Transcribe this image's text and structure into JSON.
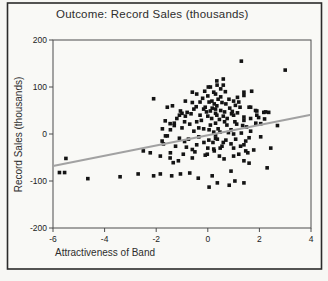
{
  "figure": {
    "background": "#f7f7f4",
    "outer_border_color": "#2b2b2b",
    "plot_frame_color": "#4d4d4d",
    "plot_bg": "#f9f9f6"
  },
  "chart_data": {
    "type": "scatter",
    "title": "Outcome: Record Sales (thousands)",
    "xlabel": "Attractiveness of Band",
    "ylabel": "Record Sales (thousands)",
    "xlim": [
      -6,
      4
    ],
    "ylim": [
      -200,
      200
    ],
    "x_ticks": [
      -6,
      -4,
      -2,
      0,
      2,
      4
    ],
    "y_ticks": [
      200,
      100,
      0,
      -100,
      -200
    ],
    "grid": false,
    "legend": "none",
    "marker": {
      "shape": "square",
      "size": 3.6,
      "color": "#141414"
    },
    "regression_line": {
      "x1": -6,
      "y1": -68,
      "x2": 4,
      "y2": 41,
      "color": "#a2a2a2",
      "width": 2.2
    },
    "points": [
      [
        -5.75,
        -82
      ],
      [
        -5.55,
        -82
      ],
      [
        -5.5,
        -52
      ],
      [
        -4.65,
        -95
      ],
      [
        -3.4,
        -91
      ],
      [
        -2.7,
        -85
      ],
      [
        -2.5,
        -36
      ],
      [
        -2.23,
        -40
      ],
      [
        -2.1,
        75
      ],
      [
        -2.1,
        -89
      ],
      [
        -1.84,
        -47
      ],
      [
        -1.84,
        -85
      ],
      [
        -1.77,
        -15
      ],
      [
        -1.76,
        11
      ],
      [
        -1.72,
        -21
      ],
      [
        -1.65,
        28
      ],
      [
        -1.64,
        -4
      ],
      [
        -1.57,
        57
      ],
      [
        -1.57,
        -4
      ],
      [
        -1.46,
        22
      ],
      [
        -1.46,
        -51
      ],
      [
        -1.45,
        9
      ],
      [
        -1.45,
        -40
      ],
      [
        -1.4,
        -89
      ],
      [
        -1.37,
        60
      ],
      [
        -1.34,
        -61
      ],
      [
        -1.3,
        18
      ],
      [
        -1.3,
        23
      ],
      [
        -1.25,
        -26
      ],
      [
        -1.2,
        33
      ],
      [
        -1.14,
        -57
      ],
      [
        -1.1,
        40
      ],
      [
        -1.1,
        -9
      ],
      [
        -1.06,
        49
      ],
      [
        -1.06,
        -85
      ],
      [
        -1.0,
        44
      ],
      [
        -1.0,
        13
      ],
      [
        -0.95,
        -43
      ],
      [
        -0.9,
        -16
      ],
      [
        -0.9,
        26
      ],
      [
        -0.87,
        70
      ],
      [
        -0.87,
        38
      ],
      [
        -0.83,
        -28
      ],
      [
        -0.8,
        46
      ],
      [
        -0.75,
        -11
      ],
      [
        -0.7,
        21
      ],
      [
        -0.7,
        -83
      ],
      [
        -0.65,
        43
      ],
      [
        -0.6,
        89
      ],
      [
        -0.6,
        67
      ],
      [
        -0.6,
        -51
      ],
      [
        -0.6,
        -33
      ],
      [
        -0.54,
        53
      ],
      [
        -0.54,
        6
      ],
      [
        -0.5,
        -38
      ],
      [
        -0.45,
        58
      ],
      [
        -0.43,
        85
      ],
      [
        -0.43,
        26
      ],
      [
        -0.43,
        -23
      ],
      [
        -0.37,
        -94
      ],
      [
        -0.35,
        -6
      ],
      [
        -0.35,
        13
      ],
      [
        -0.3,
        68
      ],
      [
        -0.3,
        40
      ],
      [
        -0.25,
        29
      ],
      [
        -0.2,
        76
      ],
      [
        -0.16,
        53
      ],
      [
        -0.16,
        11
      ],
      [
        -0.15,
        -18
      ],
      [
        -0.12,
        91
      ],
      [
        -0.1,
        57
      ],
      [
        -0.1,
        -45
      ],
      [
        -0.05,
        47
      ],
      [
        -0.02,
        -43
      ],
      [
        0.0,
        81
      ],
      [
        0.0,
        38
      ],
      [
        0.0,
        -30
      ],
      [
        0.02,
        100
      ],
      [
        0.04,
        -13
      ],
      [
        0.05,
        68
      ],
      [
        0.05,
        9
      ],
      [
        0.05,
        -113
      ],
      [
        0.1,
        49
      ],
      [
        0.1,
        19
      ],
      [
        0.1,
        100
      ],
      [
        0.15,
        33
      ],
      [
        0.16,
        70
      ],
      [
        0.17,
        55
      ],
      [
        0.17,
        -89
      ],
      [
        0.2,
        -18
      ],
      [
        0.23,
        89
      ],
      [
        0.23,
        4
      ],
      [
        0.23,
        -32
      ],
      [
        0.25,
        64
      ],
      [
        0.25,
        -36
      ],
      [
        0.3,
        44
      ],
      [
        0.3,
        53
      ],
      [
        0.3,
        85
      ],
      [
        0.3,
        23
      ],
      [
        0.3,
        -2
      ],
      [
        0.3,
        -9
      ],
      [
        0.35,
        113
      ],
      [
        0.35,
        60
      ],
      [
        0.35,
        40
      ],
      [
        0.36,
        104
      ],
      [
        0.37,
        -11
      ],
      [
        0.37,
        -104
      ],
      [
        0.4,
        74
      ],
      [
        0.4,
        11
      ],
      [
        0.45,
        31
      ],
      [
        0.45,
        -47
      ],
      [
        0.47,
        4
      ],
      [
        0.48,
        -30
      ],
      [
        0.5,
        50
      ],
      [
        0.5,
        79
      ],
      [
        0.5,
        96
      ],
      [
        0.55,
        67
      ],
      [
        0.55,
        -26
      ],
      [
        0.6,
        104
      ],
      [
        0.6,
        117
      ],
      [
        0.6,
        38
      ],
      [
        0.6,
        -18
      ],
      [
        0.63,
        -53
      ],
      [
        0.65,
        47
      ],
      [
        0.65,
        26
      ],
      [
        0.68,
        90
      ],
      [
        0.7,
        64
      ],
      [
        0.7,
        -13
      ],
      [
        0.74,
        19
      ],
      [
        0.75,
        33
      ],
      [
        0.8,
        3
      ],
      [
        0.82,
        74
      ],
      [
        0.83,
        -109
      ],
      [
        0.85,
        55
      ],
      [
        0.9,
        9
      ],
      [
        0.9,
        -79
      ],
      [
        0.9,
        -21
      ],
      [
        0.92,
        43
      ],
      [
        0.95,
        48
      ],
      [
        1.0,
        70
      ],
      [
        1.0,
        40
      ],
      [
        1.0,
        0
      ],
      [
        1.0,
        -30
      ],
      [
        1.0,
        -47
      ],
      [
        1.05,
        26
      ],
      [
        1.05,
        -100
      ],
      [
        1.07,
        61
      ],
      [
        1.08,
        -11
      ],
      [
        1.12,
        21
      ],
      [
        1.15,
        78
      ],
      [
        1.15,
        45
      ],
      [
        1.2,
        68
      ],
      [
        1.2,
        -43
      ],
      [
        1.25,
        57
      ],
      [
        1.27,
        -26
      ],
      [
        1.3,
        155
      ],
      [
        1.3,
        2
      ],
      [
        1.35,
        18
      ],
      [
        1.4,
        82
      ],
      [
        1.4,
        89
      ],
      [
        1.4,
        36
      ],
      [
        1.4,
        29
      ],
      [
        1.4,
        -23
      ],
      [
        1.4,
        -57
      ],
      [
        1.4,
        -104
      ],
      [
        1.47,
        -15
      ],
      [
        1.47,
        -36
      ],
      [
        1.5,
        15
      ],
      [
        1.55,
        -40
      ],
      [
        1.6,
        57
      ],
      [
        1.6,
        -8
      ],
      [
        1.6,
        -62
      ],
      [
        1.66,
        33
      ],
      [
        1.66,
        57
      ],
      [
        1.66,
        6
      ],
      [
        1.7,
        91
      ],
      [
        1.78,
        -34
      ],
      [
        1.85,
        50
      ],
      [
        1.86,
        23
      ],
      [
        1.9,
        49
      ],
      [
        1.9,
        40
      ],
      [
        1.97,
        35
      ],
      [
        2.05,
        22
      ],
      [
        2.05,
        -6
      ],
      [
        2.17,
        46
      ],
      [
        2.2,
        32
      ],
      [
        2.24,
        47
      ],
      [
        2.3,
        -72
      ],
      [
        2.36,
        46
      ],
      [
        2.44,
        -30
      ],
      [
        2.7,
        18
      ],
      [
        3.0,
        136
      ]
    ]
  }
}
